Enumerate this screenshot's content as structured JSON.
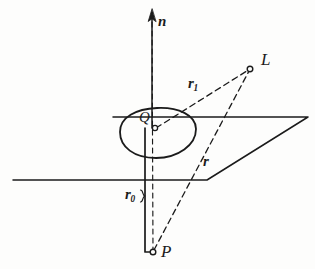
{
  "figure": {
    "background_color": "#fdfdfc",
    "ink_color": "#1b1b1b",
    "width": 315,
    "height": 269
  },
  "labels": {
    "normal_vector": {
      "text": "n",
      "style": "bold-italic",
      "kind": "vector"
    },
    "light_point": {
      "text": "L",
      "style": "italic",
      "kind": "point"
    },
    "vector_r1": {
      "text": "r",
      "subscript": "1",
      "style": "bold-italic",
      "kind": "vector"
    },
    "surface_point": {
      "text": "Q",
      "style": "italic",
      "kind": "point"
    },
    "vector_r": {
      "text": "r",
      "subscript": "",
      "style": "bold-italic",
      "kind": "vector"
    },
    "vector_r0": {
      "text": "r",
      "subscript": "0",
      "style": "bold-italic",
      "kind": "vector"
    },
    "origin_point": {
      "text": "P",
      "style": "italic",
      "kind": "point"
    }
  },
  "geometry": {
    "plane": {
      "name": "ground-plane-parallelogram",
      "corners": [
        [
          13,
          180
        ],
        [
          207,
          180
        ],
        [
          308,
          117
        ],
        [
          113,
          117
        ]
      ],
      "line_style": "solid"
    },
    "normal_axis": {
      "name": "normal-arrow",
      "from": [
        152,
        128
      ],
      "to": [
        152,
        12
      ],
      "arrowhead": true,
      "line_style": "solid"
    },
    "patch": {
      "name": "surface-patch-blob",
      "center": [
        157,
        132
      ],
      "rx": 38,
      "ry": 25,
      "line_style": "solid"
    },
    "ray_Q_to_L": {
      "name": "segment-r1",
      "from": [
        155,
        128
      ],
      "to": [
        250,
        69
      ],
      "line_style": "dashed"
    },
    "ray_P_to_L": {
      "name": "segment-r",
      "from": [
        153,
        252
      ],
      "to": [
        250,
        69
      ],
      "line_style": "dashed"
    },
    "axis_P_to_n": {
      "name": "segment-vertical-dashed",
      "from": [
        153,
        252
      ],
      "to": [
        152,
        12
      ],
      "line_style": "dashed"
    },
    "bracket_r0": {
      "name": "segment-r0-bracket",
      "from": [
        145,
        128
      ],
      "to": [
        145,
        252
      ],
      "line_style": "solid"
    },
    "markers": [
      {
        "name": "point-marker-Q",
        "at": [
          155,
          128
        ],
        "radius": 2.6
      },
      {
        "name": "point-marker-L",
        "at": [
          250,
          69
        ],
        "radius": 2.8
      },
      {
        "name": "point-marker-P",
        "at": [
          153,
          252
        ],
        "radius": 2.8
      }
    ]
  }
}
